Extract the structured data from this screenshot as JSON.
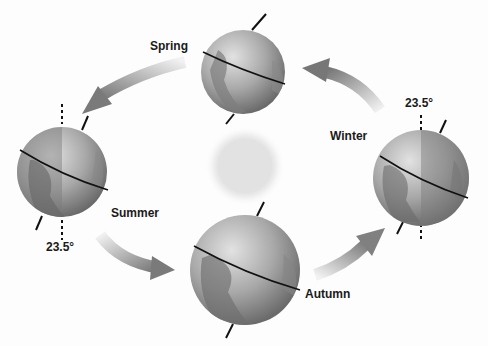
{
  "diagram": {
    "labels": {
      "spring": "Spring",
      "summer": "Summer",
      "autumn": "Autumn",
      "winter": "Winter",
      "tilt_left": "23.5°",
      "tilt_right": "23.5°"
    },
    "nodes": [
      {
        "id": "sun",
        "label": "",
        "x": 245,
        "y": 165
      },
      {
        "id": "earth-spring",
        "label": "Spring",
        "x": 243,
        "y": 72
      },
      {
        "id": "earth-summer",
        "label": "Summer",
        "x": 62,
        "y": 172
      },
      {
        "id": "earth-autumn",
        "label": "Autumn",
        "x": 245,
        "y": 270
      },
      {
        "id": "earth-winter",
        "label": "Winter",
        "x": 421,
        "y": 178
      }
    ],
    "edges": [
      {
        "from": "earth-spring",
        "to": "earth-summer"
      },
      {
        "from": "earth-summer",
        "to": "earth-autumn"
      },
      {
        "from": "earth-autumn",
        "to": "earth-winter"
      },
      {
        "from": "earth-winter",
        "to": "earth-spring"
      }
    ],
    "axial_tilt_degrees": "23.5°",
    "colors": {
      "arrow": "#7a7a7a",
      "earth_light": "#d9d9d9",
      "earth_dark": "#6e6e6e",
      "sun": "#e0e0e0"
    }
  }
}
